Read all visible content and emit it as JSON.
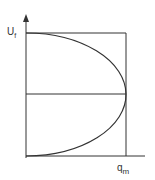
{
  "diagram": {
    "y_axis_label": "U",
    "y_axis_label_sub": "f",
    "x_axis_label": "q",
    "x_axis_label_sub": "m",
    "line_color": "#333333"
  }
}
